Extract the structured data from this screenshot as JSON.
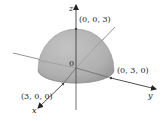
{
  "diagram": {
    "type": "3d-surface",
    "shape": "upper hemisphere",
    "radius": 3,
    "axes": {
      "x": {
        "label": "x"
      },
      "y": {
        "label": "y"
      },
      "z": {
        "label": "z"
      }
    },
    "origin_label": "0",
    "points": [
      {
        "id": "z-top",
        "label": "(0, 0, 3)"
      },
      {
        "id": "y-point",
        "label": "(0, 3, 0)"
      },
      {
        "id": "x-point",
        "label": "(3, 0, 0)"
      }
    ],
    "colors": {
      "surface": "#b8b8b8",
      "surface_shade": "#9a9a9a",
      "axis": "#333333",
      "background": "#ffffff"
    }
  }
}
